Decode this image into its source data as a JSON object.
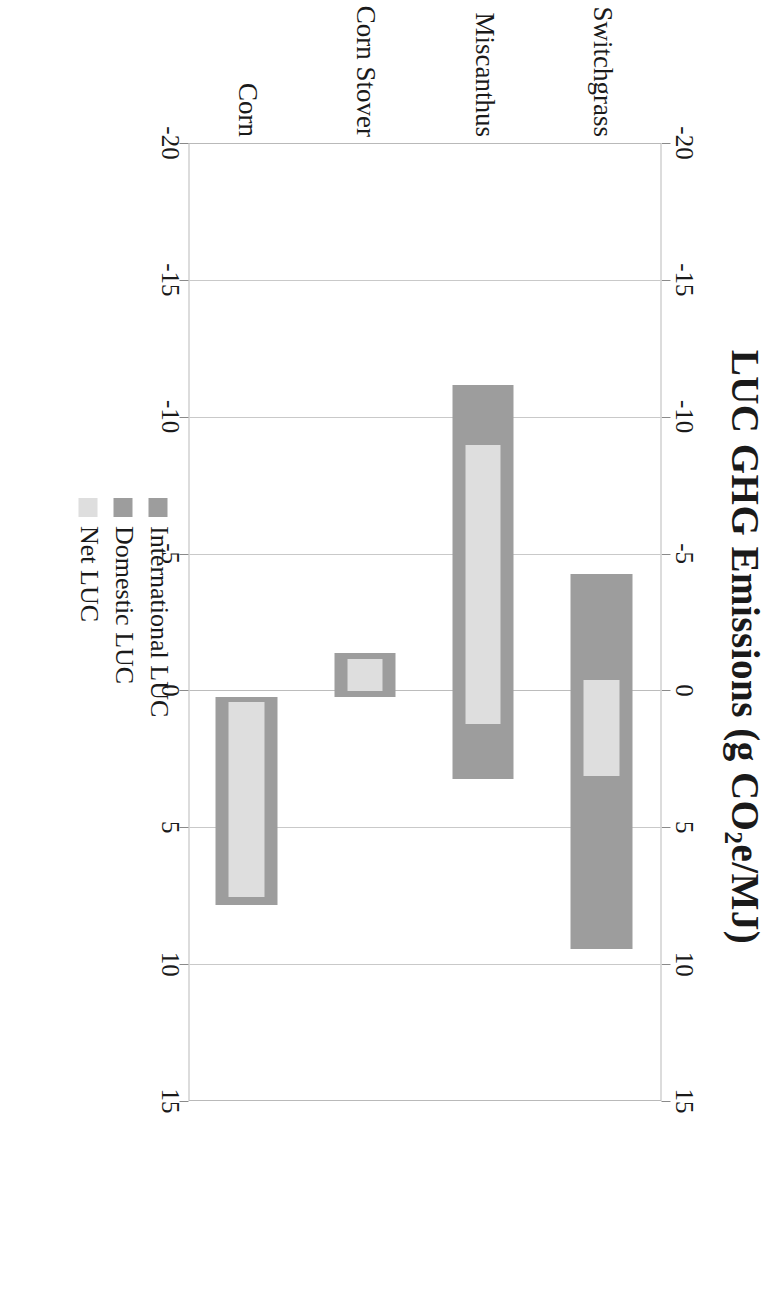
{
  "chart_data": {
    "type": "bar",
    "orientation": "horizontal-rotated-90",
    "title": "LUC GHG Emissions (g CO2e/MJ)",
    "title_parts": {
      "pre": "LUC GHG Emissions (g CO",
      "sub": "2",
      "post": "e/MJ)"
    },
    "xlabel": "LUC GHG Emissions (g CO2e/MJ)",
    "ylabel": "",
    "xlim": [
      -20,
      15
    ],
    "ticks": [
      -20,
      -15,
      -10,
      -5,
      0,
      5,
      10,
      15
    ],
    "tick_labels": [
      "-20",
      "-15",
      "-10",
      "-5",
      "0",
      "5",
      "10",
      "15"
    ],
    "grid": true,
    "axis_duplicated_top_and_bottom": true,
    "categories": [
      "Switchgrass",
      "Miscanthus",
      "Corn Stover",
      "Corn"
    ],
    "legend": {
      "position": "inside-lower-left",
      "entries": [
        {
          "name": "International LUC",
          "color": "#9d9d9d"
        },
        {
          "name": "Domestic LUC",
          "color": "#9d9d9d"
        },
        {
          "name": "Net LUC",
          "color": "#dedede"
        }
      ]
    },
    "series": [
      {
        "name": "Total LUC range (International + Domestic)",
        "color": "#9d9d9d",
        "values": [
          {
            "category": "Switchgrass",
            "start": -4.3,
            "end": 9.4
          },
          {
            "category": "Miscanthus",
            "start": -11.2,
            "end": 3.2
          },
          {
            "category": "Corn Stover",
            "start": -1.4,
            "end": 0.2
          },
          {
            "category": "Corn",
            "start": 0.2,
            "end": 7.8
          }
        ]
      },
      {
        "name": "Net LUC",
        "color": "#dedede",
        "values": [
          {
            "category": "Switchgrass",
            "start": -0.4,
            "end": 3.1
          },
          {
            "category": "Miscanthus",
            "start": -9.0,
            "end": 1.2
          },
          {
            "category": "Corn Stover",
            "start": -1.2,
            "end": 0.0
          },
          {
            "category": "Corn",
            "start": 0.4,
            "end": 7.5
          }
        ]
      }
    ]
  },
  "title": {
    "pre": "LUC GHG Emissions (g CO",
    "sub": "2",
    "post": "e/MJ)"
  },
  "axis": {
    "tick_labels": [
      "-20",
      "-15",
      "-10",
      "-5",
      "0",
      "5",
      "10",
      "15"
    ]
  },
  "categories": [
    "Switchgrass",
    "Miscanthus",
    "Corn Stover",
    "Corn"
  ],
  "legend": {
    "items": [
      {
        "label": "International LUC",
        "color": "#9d9d9d"
      },
      {
        "label": "Domestic LUC",
        "color": "#9d9d9d"
      },
      {
        "label": "Net LUC",
        "color": "#dedede"
      }
    ]
  },
  "colors": {
    "bar_outer": "#9d9d9d",
    "bar_inner": "#dedede",
    "grid": "#c9c9c9",
    "frame": "#b9b9b9",
    "text": "#1a1a1a",
    "background": "#ffffff"
  }
}
